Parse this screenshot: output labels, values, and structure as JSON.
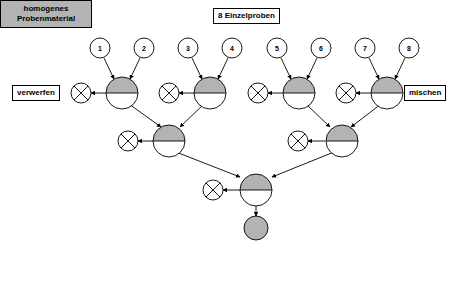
{
  "diagram": {
    "title": "8 Einzelproben",
    "left_label": "verwerfen",
    "right_label": "mischen",
    "result_line1": "homogenes",
    "result_line2": "Probenmaterial",
    "colors": {
      "node_fill_gray": "#b3b3b3",
      "node_fill_white": "#ffffff",
      "stroke": "#000000",
      "result_box_fill": "#b3b3b3",
      "page_background": "#ffffff"
    },
    "samples": [
      {
        "label": "1"
      },
      {
        "label": "2"
      },
      {
        "label": "3"
      },
      {
        "label": "4"
      },
      {
        "label": "5"
      },
      {
        "label": "6"
      },
      {
        "label": "7"
      },
      {
        "label": "8"
      }
    ],
    "levels": {
      "level1_nodes": 4,
      "level2_nodes": 2,
      "level3_nodes": 1,
      "discard_nodes": 7,
      "final_nodes": 1
    }
  }
}
